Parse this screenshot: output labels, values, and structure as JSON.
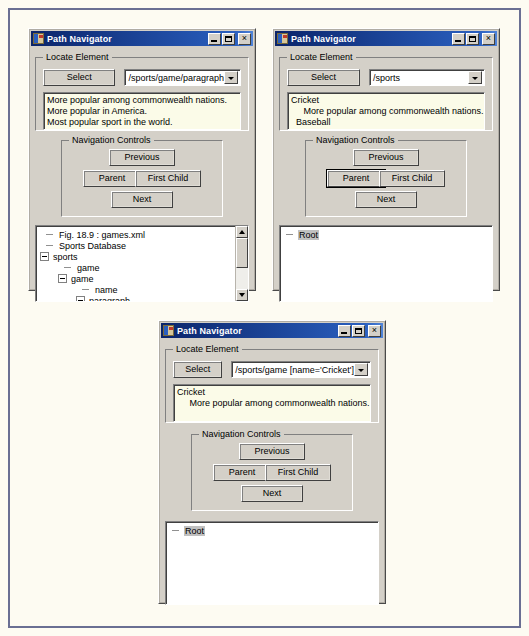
{
  "page": {
    "background": "#fdfbf2",
    "frame_color": "#6a6f93"
  },
  "common": {
    "window_title": "Path Navigator",
    "minimize_label": "_",
    "maximize_label": "□",
    "close_label": "×",
    "locate_group_title": "Locate Element",
    "select_button": "Select",
    "nav_group_title": "Navigation Controls",
    "previous_button": "Previous",
    "parent_button": "Parent",
    "first_child_button": "First Child",
    "next_button": "Next",
    "colors": {
      "titlebar_start": "#0a246a",
      "titlebar_end": "#2a5fbf",
      "face": "#d4d0c8",
      "textbox_bg": "#fbfbe8",
      "tree_bg": "#ffffff",
      "selection": "#c0c0c0"
    }
  },
  "windows": [
    {
      "id": "win1",
      "title": "Path Navigator",
      "path_value": "/sports/game/paragraph",
      "result_lines": [
        "More popular among commonwealth nations.",
        "More popular in America.",
        "Most popular sport in the world."
      ],
      "focused_button": "",
      "tree": [
        {
          "label": "Fig. 18.9 : games.xml",
          "indent": 0,
          "marker": "dash",
          "selected": false
        },
        {
          "label": "Sports Database",
          "indent": 0,
          "marker": "dash",
          "selected": false
        },
        {
          "label": "sports",
          "indent": 0,
          "marker": "minus",
          "selected": false
        },
        {
          "label": "game",
          "indent": 1,
          "marker": "dash",
          "selected": false
        },
        {
          "label": "game",
          "indent": 1,
          "marker": "minus",
          "selected": false
        },
        {
          "label": "name",
          "indent": 2,
          "marker": "dash",
          "selected": false
        },
        {
          "label": "paragraph",
          "indent": 2,
          "marker": "minus",
          "selected": false
        },
        {
          "label": "More popular in America.",
          "indent": 3,
          "marker": "dash",
          "selected": true
        }
      ],
      "scrollbar": true
    },
    {
      "id": "win2",
      "title": "Path Navigator",
      "path_value": "/sports",
      "result_lines": [
        "Cricket",
        "     More popular among commonwealth nations.",
        "  Baseball"
      ],
      "focused_button": "parent",
      "tree": [
        {
          "label": "Root",
          "indent": 0,
          "marker": "dash",
          "selected": true
        }
      ],
      "scrollbar": false
    },
    {
      "id": "win3",
      "title": "Path Navigator",
      "path_value": "/sports/game [name='Cricket']",
      "result_lines": [
        "Cricket",
        "     More popular among commonwealth nations."
      ],
      "focused_button": "",
      "tree": [
        {
          "label": "Root",
          "indent": 0,
          "marker": "dash",
          "selected": true
        }
      ],
      "scrollbar": false
    }
  ]
}
